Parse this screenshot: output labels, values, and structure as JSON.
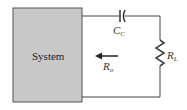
{
  "diagram": {
    "system_label": "System",
    "capacitor": {
      "symbol": "C",
      "subscript": "C"
    },
    "resistor_load": {
      "symbol": "R",
      "subscript": "L"
    },
    "output_resistance": {
      "symbol": "R",
      "subscript": "o"
    },
    "colors": {
      "box_fill": "#c8c8c8",
      "box_border": "#555555",
      "wire": "#444444"
    }
  }
}
